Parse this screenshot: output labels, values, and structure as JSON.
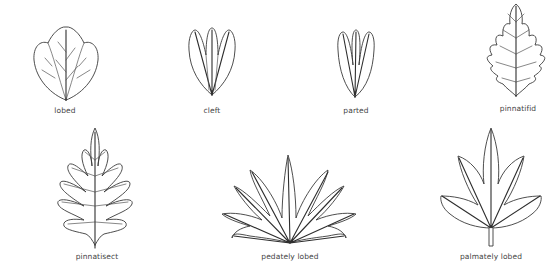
{
  "diagram": {
    "type": "leaf-shape-glossary",
    "line_color": "#3a3a3a",
    "background": "#ffffff",
    "items": [
      {
        "id": "lobed",
        "label": "lobed",
        "x": 65,
        "y": 107
      },
      {
        "id": "cleft",
        "label": "cleft",
        "x": 212,
        "y": 107
      },
      {
        "id": "parted",
        "label": "parted",
        "x": 356,
        "y": 107
      },
      {
        "id": "pinnatifid",
        "label": "pinnatifid",
        "x": 518,
        "y": 105
      },
      {
        "id": "pinnatisect",
        "label": "pinnatisect",
        "x": 97,
        "y": 253
      },
      {
        "id": "pedately-lobed",
        "label": "pedately lobed",
        "x": 290,
        "y": 253
      },
      {
        "id": "palmately-lobed",
        "label": "palmately lobed",
        "x": 491,
        "y": 253
      }
    ]
  }
}
